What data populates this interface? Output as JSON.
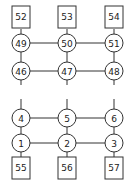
{
  "diagram": {
    "top_squares": [
      "52",
      "53",
      "54"
    ],
    "row_upper": [
      "49",
      "50",
      "51"
    ],
    "row_second": [
      "46",
      "47",
      "48"
    ],
    "row_third": [
      "4",
      "5",
      "6"
    ],
    "row_bottom": [
      "1",
      "2",
      "3"
    ],
    "bottom_squares": [
      "55",
      "56",
      "57"
    ],
    "colors": {
      "stroke": "#333333",
      "background": "#ffffff"
    }
  }
}
